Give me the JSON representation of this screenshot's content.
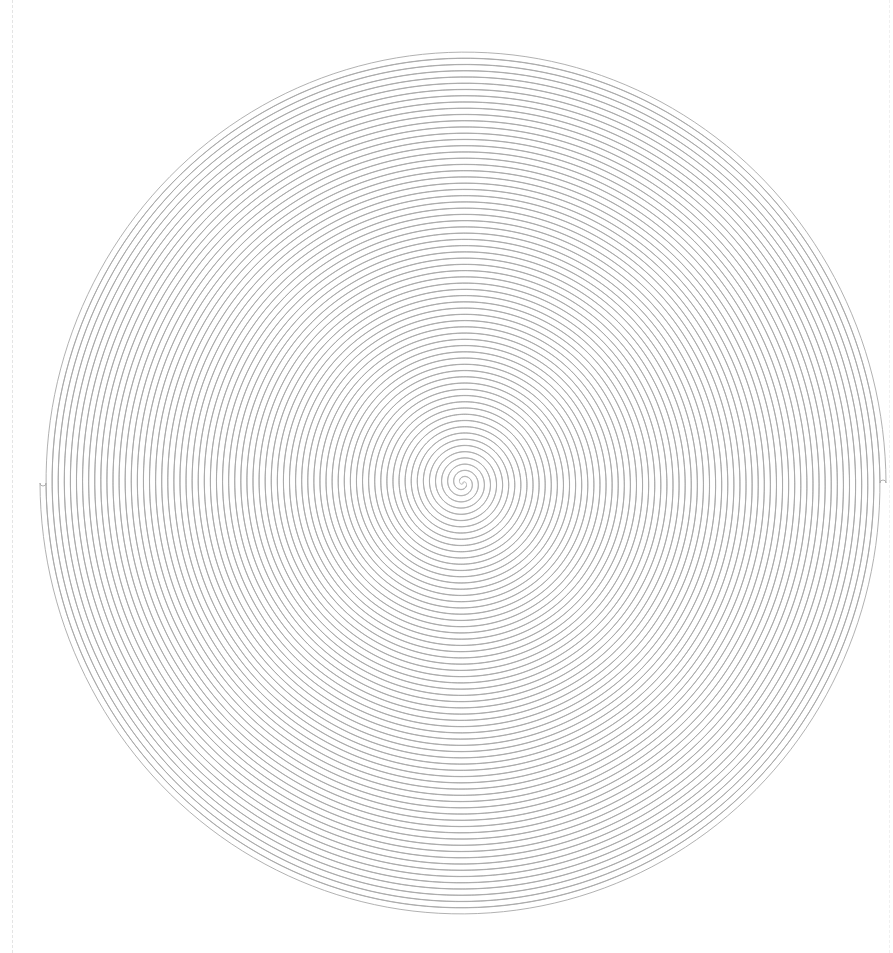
{
  "canvas": {
    "width": 893,
    "height": 953,
    "background": "#ffffff"
  },
  "spiral": {
    "type": "double-arm-archimedean-spiral",
    "center": {
      "x": 463,
      "y": 483
    },
    "turns": 34.5,
    "outer_radius_x": 420,
    "outer_radius_y": 431,
    "arm_gap": 6,
    "stroke_color": "#a8a8a8",
    "stroke_width": 0.9,
    "outer_end_left": {
      "x": 42,
      "y": 482
    },
    "outer_end_right": {
      "x": 870,
      "y": 478
    }
  },
  "guides": {
    "left_dashed_line_x": 12,
    "color": "#e4e4e4"
  }
}
